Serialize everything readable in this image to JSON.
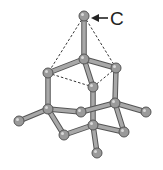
{
  "diagram": {
    "label": "C",
    "colors": {
      "atom": "#9a9a9a",
      "bond": "#a8a8a8",
      "outline": "#555555",
      "dashed": "#333333",
      "text": "#222222"
    },
    "atoms": [
      {
        "id": "c_top",
        "x": 84,
        "y": 16
      },
      {
        "id": "a1",
        "x": 84,
        "y": 59
      },
      {
        "id": "a2",
        "x": 48,
        "y": 73
      },
      {
        "id": "a3",
        "x": 116,
        "y": 68
      },
      {
        "id": "a4",
        "x": 93,
        "y": 87
      },
      {
        "id": "a5",
        "x": 48,
        "y": 109
      },
      {
        "id": "a6",
        "x": 81,
        "y": 112
      },
      {
        "id": "a7",
        "x": 115,
        "y": 103
      },
      {
        "id": "a8",
        "x": 19,
        "y": 121
      },
      {
        "id": "a9",
        "x": 146,
        "y": 112
      },
      {
        "id": "a10",
        "x": 93,
        "y": 125
      },
      {
        "id": "a11",
        "x": 64,
        "y": 135
      },
      {
        "id": "a12",
        "x": 124,
        "y": 132
      },
      {
        "id": "a13",
        "x": 97,
        "y": 153
      }
    ],
    "bonds": [
      [
        "c_top",
        "a1"
      ],
      [
        "a1",
        "a2"
      ],
      [
        "a1",
        "a3"
      ],
      [
        "a1",
        "a4"
      ],
      [
        "a2",
        "a5"
      ],
      [
        "a3",
        "a7"
      ],
      [
        "a4",
        "a10"
      ],
      [
        "a5",
        "a6"
      ],
      [
        "a6",
        "a7"
      ],
      [
        "a5",
        "a8"
      ],
      [
        "a7",
        "a9"
      ],
      [
        "a5",
        "a11"
      ],
      [
        "a11",
        "a10"
      ],
      [
        "a10",
        "a12"
      ],
      [
        "a7",
        "a12"
      ],
      [
        "a10",
        "a13"
      ]
    ],
    "dashed": [
      [
        "c_top",
        "a2"
      ],
      [
        "c_top",
        "a3"
      ],
      [
        "a2",
        "a4"
      ],
      [
        "a3",
        "a4"
      ]
    ]
  }
}
